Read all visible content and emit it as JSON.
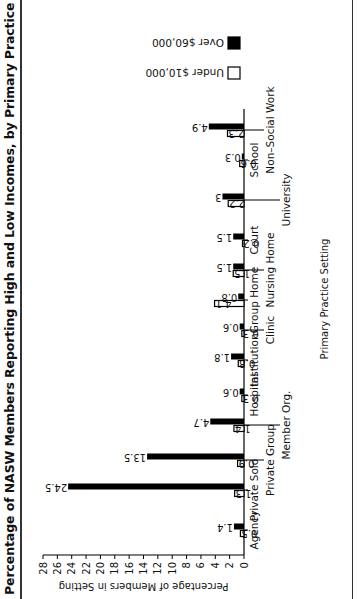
{
  "title": "Percentage of NASW Members Reporting High and Low Incomes, by Primary Practice Setting, 1991",
  "colors": {
    "under": "#ffffff",
    "over": "#000000",
    "stroke": "#000000"
  },
  "legend": [
    {
      "label": "Under $10,000",
      "key": "under"
    },
    {
      "label": "Over $60,000",
      "key": "over"
    }
  ],
  "chart_data": {
    "type": "bar",
    "orientation": "vertical (image rotated 90° counter-clockwise)",
    "title": "Percentage of NASW Members Reporting High and Low Incomes, by Primary Practice Setting, 1991",
    "xlabel": "Primary Practice Setting",
    "ylabel": "Percentage of Members in Setting",
    "ylim": [
      0,
      28
    ],
    "yticks": [
      0,
      2,
      4,
      6,
      8,
      10,
      12,
      14,
      16,
      18,
      20,
      22,
      24,
      26,
      28
    ],
    "grid": false,
    "legend_position": "top-right",
    "categories": [
      "Agency",
      "Private Solo",
      "Private Group",
      "Member Org.",
      "Hospital",
      "Institution",
      "Clinic",
      "Group Home",
      "Nursing Home",
      "Court",
      "University",
      "School",
      "Non–Social Work"
    ],
    "series": [
      {
        "name": "Under $10,000",
        "values": [
          0.5,
          1.3,
          0.9,
          1.4,
          0.3,
          0.8,
          0.3,
          4.1,
          1.5,
          0.2,
          2.2,
          0.6,
          2.3
        ]
      },
      {
        "name": "Over $60,000",
        "values": [
          1.4,
          24.5,
          13.5,
          4.7,
          0.6,
          1.8,
          0.6,
          0.8,
          1.5,
          1.5,
          3,
          0.3,
          4.9
        ]
      }
    ],
    "value_labels": {
      "under": [
        "0.5",
        "1.3",
        "0.9",
        "1.4",
        "0.3",
        "0.8",
        "0.3",
        "4.1",
        "1.5",
        "0.2",
        "2.2",
        "0.6",
        "2.3"
      ],
      "over": [
        "1.4",
        "24.5",
        "13.5",
        "4.7",
        "0.6",
        "1.8",
        "0.6",
        "0.8",
        "1.5",
        "1.5",
        "3",
        "0.3",
        "4.9"
      ]
    },
    "category_label_rows": [
      0,
      0,
      1,
      2,
      0,
      0,
      1,
      0,
      1,
      0,
      2,
      0,
      1
    ]
  },
  "layout": {
    "baseline_y": 244,
    "top_y": 43,
    "axis_x": 44,
    "category_x": [
      69,
      109,
      139,
      174,
      204,
      239,
      269,
      299,
      329,
      359,
      399,
      439,
      469
    ],
    "bar_width": 6
  }
}
